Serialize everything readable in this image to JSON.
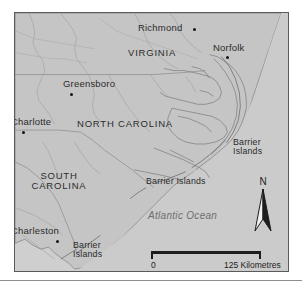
{
  "map": {
    "title": "Map of North Carolina, South Carolina and Virginia coastal region",
    "colors": {
      "ocean": "#cfcfcf",
      "land": "#c4c4c4",
      "border": "#5a5a5a",
      "coastline": "#7a7a7a",
      "state_line": "#8a8a8a",
      "river": "#9a9a9a",
      "label": "#2b2b2b",
      "ocean_label": "#6e6e6e"
    },
    "states": [
      {
        "name": "VIRGINIA"
      },
      {
        "name": "NORTH CAROLINA"
      },
      {
        "name": "SOUTH",
        "name2": "CAROLINA"
      }
    ],
    "cities": [
      {
        "name": "Richmond"
      },
      {
        "name": "Norfolk"
      },
      {
        "name": "Greensboro"
      },
      {
        "name": "Charlotte"
      },
      {
        "name": "Charleston"
      }
    ],
    "features": [
      {
        "line1": "Barrier",
        "line2": "Islands"
      },
      {
        "name": "Barrier Islands"
      },
      {
        "line1": "Barrier",
        "line2": "Islands"
      }
    ],
    "ocean": {
      "name": "Atlantic Ocean"
    },
    "north_arrow": {
      "label": "N",
      "icon": "north-arrow-icon"
    },
    "scale": {
      "zero_label": "0",
      "max_label": "125 Kilometres"
    }
  }
}
